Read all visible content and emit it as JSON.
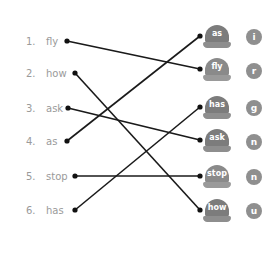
{
  "left_items": [
    {
      "num": "1.",
      "word": "fly"
    },
    {
      "num": "2.",
      "word": "how"
    },
    {
      "num": "3.",
      "word": "ask"
    },
    {
      "num": "4.",
      "word": "as"
    },
    {
      "num": "5.",
      "word": "stop"
    },
    {
      "num": "6.",
      "word": "has"
    }
  ],
  "right_items": [
    {
      "cap": "as",
      "letter": "i"
    },
    {
      "cap": "fly",
      "letter": "r"
    },
    {
      "cap": "has",
      "letter": "g"
    },
    {
      "cap": "ask",
      "letter": "n"
    },
    {
      "cap": "stop",
      "letter": "n"
    },
    {
      "cap": "how",
      "letter": "u"
    }
  ],
  "connections": [
    {
      "from": "fly",
      "to": "fly"
    },
    {
      "from": "how",
      "to": "how"
    },
    {
      "from": "ask",
      "to": "ask"
    },
    {
      "from": "as",
      "to": "as"
    },
    {
      "from": "stop",
      "to": "stop"
    },
    {
      "from": "has",
      "to": "has"
    }
  ]
}
